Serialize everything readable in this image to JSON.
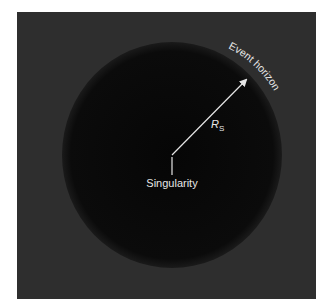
{
  "diagram": {
    "labels": {
      "event_horizon": "Event horizon",
      "radius_symbol": "R",
      "radius_subscript": "S",
      "singularity": "Singularity"
    },
    "colors": {
      "page_background": "#ffffff",
      "space_background": "#2e2e2e",
      "black_hole": "#0a0a0a",
      "annotation": "#e6e6e6"
    }
  }
}
